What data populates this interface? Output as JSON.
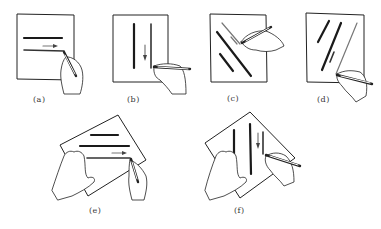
{
  "figure": {
    "ink_color": "#1a1a1a",
    "paper_color": "#ffffff",
    "panels": [
      {
        "id": "a",
        "label": "(a)",
        "content": "horizontal lines drawn left-to-right, arrow pointing right"
      },
      {
        "id": "b",
        "label": "(b)",
        "content": "vertical lines drawn top-to-bottom, arrow pointing down"
      },
      {
        "id": "c",
        "label": "(c)",
        "content": "diagonal lines drawn from upper-left to lower-right"
      },
      {
        "id": "d",
        "label": "(d)",
        "content": "diagonal lines drawn from upper-right to lower-left"
      },
      {
        "id": "e",
        "label": "(e)",
        "content": "rotated paper held with left hand, horizontal lines with arrow pointing right"
      },
      {
        "id": "f",
        "label": "(f)",
        "content": "rotated paper held with left hand, vertical lines with arrow pointing down"
      }
    ]
  }
}
